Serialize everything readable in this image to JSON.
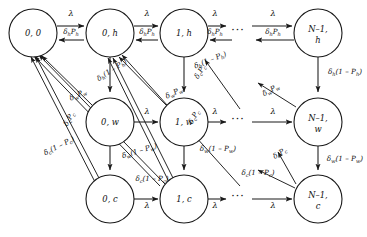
{
  "figure": {
    "kind": "markov-chain-state-transition-diagram",
    "ellipsis": "···",
    "symbols": {
      "lambda": "λ",
      "delta_h": "δ",
      "delta_w": "δ",
      "delta_c": "δ"
    }
  },
  "nodes": [
    {
      "id": "n-0-0",
      "label_main": "0, 0",
      "label_line2": "",
      "cx": 33,
      "cy": 33,
      "r": 24
    },
    {
      "id": "n-0-h",
      "label_main": "0, h",
      "label_line2": "",
      "cx": 110,
      "cy": 33,
      "r": 24
    },
    {
      "id": "n-1-h",
      "label_main": "1, h",
      "label_line2": "",
      "cx": 184,
      "cy": 33,
      "r": 24
    },
    {
      "id": "n-N-h",
      "label_main": "N–1,",
      "label_line2": "h",
      "cx": 318,
      "cy": 33,
      "r": 24
    },
    {
      "id": "n-0-w",
      "label_main": "0, w",
      "label_line2": "",
      "cx": 110,
      "cy": 122,
      "r": 24
    },
    {
      "id": "n-1-w",
      "label_main": "1, w",
      "label_line2": "",
      "cx": 184,
      "cy": 122,
      "r": 24
    },
    {
      "id": "n-N-w",
      "label_main": "N–1,",
      "label_line2": "w",
      "cx": 318,
      "cy": 122,
      "r": 24
    },
    {
      "id": "n-0-c",
      "label_main": "0, c",
      "label_line2": "",
      "cx": 110,
      "cy": 199,
      "r": 24
    },
    {
      "id": "n-1-c",
      "label_main": "1, c",
      "label_line2": "",
      "cx": 184,
      "cy": 199,
      "r": 24
    },
    {
      "id": "n-N-c",
      "label_main": "N–1,",
      "label_line2": "c",
      "cx": 318,
      "cy": 199,
      "r": 24
    }
  ],
  "ellipses": [
    {
      "id": "dots-row-h",
      "x": 238,
      "y": 34
    },
    {
      "id": "dots-row-w",
      "x": 238,
      "y": 123
    },
    {
      "id": "dots-row-c",
      "x": 238,
      "y": 200
    }
  ],
  "edge_labels": {
    "lambda": "λ",
    "delta_h_Ph": {
      "base": "δ",
      "sub": "h",
      "tail": "P",
      "tailsub": "h"
    },
    "delta_h_1mPh": {
      "base": "δ",
      "sub": "h",
      "tail": "(1 – P",
      "tailsub": "h",
      "close": ")"
    },
    "delta_w_Pw": {
      "base": "δ",
      "sub": "w",
      "tail": "P",
      "tailsub": "w"
    },
    "delta_w_1mPw": {
      "base": "δ",
      "sub": "w",
      "tail": "(1 – P",
      "tailsub": "w",
      "close": ")"
    },
    "delta_c_Pc": {
      "base": "δ",
      "sub": "c",
      "tail": "P",
      "tailsub": "c"
    },
    "delta_c_1mPc": {
      "base": "δ",
      "sub": "c",
      "tail": "(1 – P",
      "tailsub": "c",
      "close": ")"
    }
  },
  "labels": [
    {
      "id": "lbl-lam-00-0h",
      "text": "λ",
      "x": 71,
      "y": 16,
      "rot": 0,
      "cls": "lam"
    },
    {
      "id": "lbl-lam-0h-1h",
      "text": "λ",
      "x": 147,
      "y": 16,
      "rot": 0,
      "cls": "lam"
    },
    {
      "id": "lbl-lam-1h-dots",
      "text": "λ",
      "x": 215,
      "y": 16,
      "rot": 0,
      "cls": "lam"
    },
    {
      "id": "lbl-lam-dots-Nh",
      "text": "λ",
      "x": 273,
      "y": 16,
      "rot": 0,
      "cls": "lam"
    },
    {
      "id": "lbl-lam-0w-1w",
      "text": "λ",
      "x": 147,
      "y": 114,
      "rot": 0,
      "cls": "lam"
    },
    {
      "id": "lbl-lam-1w-dots",
      "text": "λ",
      "x": 215,
      "y": 114,
      "rot": 0,
      "cls": "lam"
    },
    {
      "id": "lbl-lam-dots-Nw",
      "text": "λ",
      "x": 273,
      "y": 114,
      "rot": 0,
      "cls": "lam"
    },
    {
      "id": "lbl-lam-0c-1c",
      "text": "λ",
      "x": 147,
      "y": 208,
      "rot": 0,
      "cls": "lam"
    },
    {
      "id": "lbl-lam-1c-dots",
      "text": "λ",
      "x": 215,
      "y": 208,
      "rot": 0,
      "cls": "lam"
    },
    {
      "id": "lbl-lam-dots-Nc",
      "text": "λ",
      "x": 273,
      "y": 208,
      "rot": 0,
      "cls": "lam"
    }
  ],
  "rate_labels": [
    {
      "id": "r-0h-to-00",
      "kind": "delta_h_Ph",
      "x": 71,
      "y": 34,
      "rot": 0
    },
    {
      "id": "r-1h-to-0h",
      "kind": "delta_h_Ph",
      "x": 147,
      "y": 34,
      "rot": 0
    },
    {
      "id": "r-dots-to-1h",
      "kind": "delta_h_Ph",
      "x": 215,
      "y": 34,
      "rot": 0
    },
    {
      "id": "r-Nh-to-dots",
      "kind": "delta_h_Ph",
      "x": 273,
      "y": 34,
      "rot": 0
    },
    {
      "id": "r-0h-to-0w",
      "kind": "delta_h_1mPh",
      "x": 113,
      "y": 72,
      "rot": -33
    },
    {
      "id": "r-1h-to-1w",
      "kind": "delta_h_1mPh",
      "x": 211,
      "y": 62,
      "rot": -22
    },
    {
      "id": "r-Nh-to-Nw",
      "kind": "delta_h_1mPh",
      "x": 345,
      "y": 74,
      "rot": 0
    },
    {
      "id": "r-0w-to-00",
      "kind": "delta_w_Pw",
      "x": 79,
      "y": 97,
      "rot": -25
    },
    {
      "id": "r-1w-to-0h",
      "kind": "delta_w_Pw",
      "x": 175,
      "y": 95,
      "rot": -25
    },
    {
      "id": "r-Nw-to-dots",
      "kind": "delta_w_Pw",
      "x": 272,
      "y": 92,
      "rot": -28
    },
    {
      "id": "r-0w-to-0c",
      "kind": "delta_w_1mPw",
      "x": 140,
      "y": 153,
      "rot": -17
    },
    {
      "id": "r-1w-to-1c",
      "kind": "delta_w_1mPw",
      "x": 218,
      "y": 151,
      "rot": 0
    },
    {
      "id": "r-Nw-to-Nc",
      "kind": "delta_w_1mPw",
      "x": 345,
      "y": 161,
      "rot": 0
    },
    {
      "id": "r-0c-to-00a",
      "kind": "delta_c_Pc",
      "x": 71,
      "y": 120,
      "rot": -60
    },
    {
      "id": "r-1c-to-0h",
      "kind": "delta_c_Pc",
      "x": 196,
      "y": 118,
      "rot": -60
    },
    {
      "id": "r-Nc-to-dots",
      "kind": "delta_c_Pc",
      "x": 281,
      "y": 155,
      "rot": -32
    },
    {
      "id": "r-0c-to-00b",
      "kind": "delta_c_1mPc",
      "x": 60,
      "y": 148,
      "rot": -27
    },
    {
      "id": "r-1c-to-0c",
      "kind": "delta_c_1mPc",
      "x": 152,
      "y": 181,
      "rot": 0
    },
    {
      "id": "r-Nc-to-1c",
      "kind": "delta_c_1mPc",
      "x": 258,
      "y": 175,
      "rot": 0
    },
    {
      "id": "r-1h-in-c",
      "kind": "delta_c_Pc",
      "x": 202,
      "y": 73,
      "rot": -58
    }
  ]
}
